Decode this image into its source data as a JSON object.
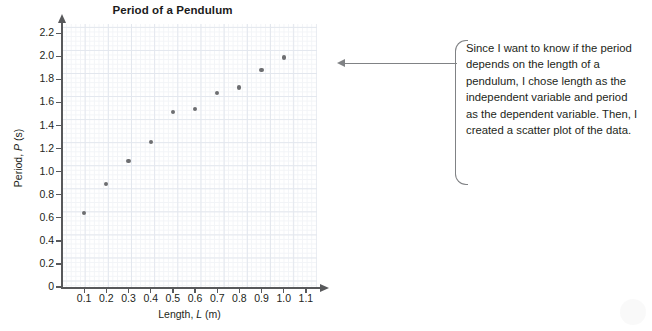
{
  "chart_data": {
    "type": "scatter",
    "title": "Period of a Pendulum",
    "xlabel": "Length, L (m)",
    "xlabel_parts": {
      "prefix": "Length, ",
      "italic": "L",
      "suffix": " (m)"
    },
    "ylabel": "Period, P (s)",
    "ylabel_parts": {
      "prefix": "Period, ",
      "italic": "P",
      "suffix": " (s)"
    },
    "xlim": [
      0,
      1.15
    ],
    "ylim": [
      0,
      2.28
    ],
    "xticks": [
      0.1,
      0.2,
      0.3,
      0.4,
      0.5,
      0.6,
      0.7,
      0.8,
      0.9,
      1.0,
      1.1
    ],
    "xtick_labels": [
      "0.1",
      "0.2",
      "0.3",
      "0.4",
      "0.5",
      "0.6",
      "0.7",
      "0.8",
      "0.9",
      "1.0",
      "1.1"
    ],
    "yticks": [
      0,
      0.2,
      0.4,
      0.6,
      0.8,
      1.0,
      1.2,
      1.4,
      1.6,
      1.8,
      2.0,
      2.2
    ],
    "ytick_labels": [
      "0",
      "0.2",
      "0.4",
      "0.6",
      "0.8",
      "1.0",
      "1.2",
      "1.4",
      "1.6",
      "1.8",
      "2.0",
      "2.2"
    ],
    "grid": true,
    "grid_minor": true,
    "legend": false,
    "point_color": "#6d6e71",
    "grid_color": "#e3e7ee",
    "grid_minor_color": "#f2f4f7",
    "axis_color": "#58595b",
    "x": [
      0.1,
      0.2,
      0.3,
      0.4,
      0.5,
      0.6,
      0.7,
      0.8,
      0.9,
      1.0
    ],
    "y": [
      0.64,
      0.89,
      1.09,
      1.26,
      1.52,
      1.54,
      1.68,
      1.73,
      1.88,
      1.99
    ],
    "points": [
      {
        "x": 0.1,
        "y": 0.64
      },
      {
        "x": 0.2,
        "y": 0.89
      },
      {
        "x": 0.3,
        "y": 1.09
      },
      {
        "x": 0.4,
        "y": 1.26
      },
      {
        "x": 0.5,
        "y": 1.52
      },
      {
        "x": 0.6,
        "y": 1.54
      },
      {
        "x": 0.7,
        "y": 1.68
      },
      {
        "x": 0.8,
        "y": 1.73
      },
      {
        "x": 0.9,
        "y": 1.88
      },
      {
        "x": 1.0,
        "y": 1.99
      }
    ]
  },
  "annotation": {
    "text": "Since I want to know if the period depends on the length of a pendulum, I chose length as the independent variable and period as the dependent variable. Then, I created a scatter plot of the data.",
    "bracket_color": "#808285",
    "arrow_color": "#808285",
    "arrow_direction": "left"
  }
}
